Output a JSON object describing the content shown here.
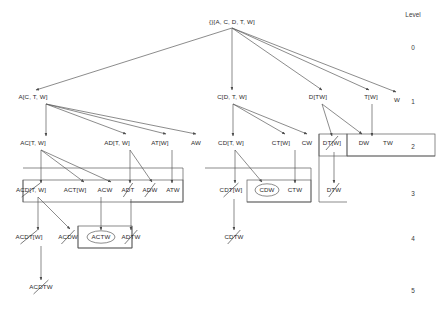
{
  "figure": {
    "type": "enumeration-tree",
    "background": "#ffffff",
    "line_color": "#5a5a5a",
    "text_color": "#2b2b2b"
  },
  "level_axis": {
    "header": "Level",
    "header_pos": {
      "x": 413,
      "y": 14
    },
    "labels": [
      {
        "text": "0",
        "x": 413,
        "y": 47
      },
      {
        "text": "1",
        "x": 413,
        "y": 101
      },
      {
        "text": "2",
        "x": 413,
        "y": 146
      },
      {
        "text": "3",
        "x": 413,
        "y": 193
      },
      {
        "text": "4",
        "x": 413,
        "y": 238
      },
      {
        "text": "5",
        "x": 413,
        "y": 290
      }
    ]
  },
  "nodes": [
    {
      "id": "root",
      "label": "{}[A, C, D, T, W]",
      "x": 232,
      "y": 22,
      "level": 0,
      "struck": false,
      "ellipse": false
    },
    {
      "id": "A",
      "label": "A[C, T, W]",
      "x": 33,
      "y": 97,
      "level": 1,
      "struck": false,
      "ellipse": false
    },
    {
      "id": "C",
      "label": "C[D, T, W]",
      "x": 232,
      "y": 97,
      "level": 1,
      "struck": false,
      "ellipse": false
    },
    {
      "id": "D",
      "label": "D[TW]",
      "x": 318,
      "y": 97,
      "level": 1,
      "struck": false,
      "ellipse": false
    },
    {
      "id": "T",
      "label": "T[W]",
      "x": 371,
      "y": 97,
      "level": 1,
      "struck": false,
      "ellipse": false
    },
    {
      "id": "W",
      "label": "W",
      "x": 397,
      "y": 100,
      "level": 1,
      "struck": false,
      "ellipse": false
    },
    {
      "id": "AC",
      "label": "AC[T, W]",
      "x": 33,
      "y": 143,
      "level": 2,
      "struck": false,
      "ellipse": false
    },
    {
      "id": "AD",
      "label": "AD[T, W]",
      "x": 117,
      "y": 143,
      "level": 2,
      "struck": false,
      "ellipse": false
    },
    {
      "id": "AT",
      "label": "AT[W]",
      "x": 160,
      "y": 143,
      "level": 2,
      "struck": false,
      "ellipse": false
    },
    {
      "id": "AW",
      "label": "AW",
      "x": 196,
      "y": 143,
      "level": 2,
      "struck": false,
      "ellipse": false
    },
    {
      "id": "CD",
      "label": "CD[T, W]",
      "x": 231,
      "y": 143,
      "level": 2,
      "struck": false,
      "ellipse": false
    },
    {
      "id": "CT",
      "label": "CT[W]",
      "x": 281,
      "y": 143,
      "level": 2,
      "struck": false,
      "ellipse": false
    },
    {
      "id": "CW",
      "label": "CW",
      "x": 307,
      "y": 143,
      "level": 2,
      "struck": false,
      "ellipse": false
    },
    {
      "id": "DT",
      "label": "DT[W]",
      "x": 332,
      "y": 143,
      "level": 2,
      "struck": true,
      "ellipse": false
    },
    {
      "id": "DW",
      "label": "DW",
      "x": 364,
      "y": 143,
      "level": 2,
      "struck": false,
      "ellipse": false
    },
    {
      "id": "TW",
      "label": "TW",
      "x": 388,
      "y": 143,
      "level": 2,
      "struck": false,
      "ellipse": false
    },
    {
      "id": "ACD",
      "label": "ACD[T, W]",
      "x": 31,
      "y": 190,
      "level": 3,
      "struck": true,
      "ellipse": false
    },
    {
      "id": "ACT",
      "label": "ACT[W]",
      "x": 75,
      "y": 190,
      "level": 3,
      "struck": false,
      "ellipse": false
    },
    {
      "id": "ACW",
      "label": "ACW",
      "x": 105,
      "y": 190,
      "level": 3,
      "struck": false,
      "ellipse": false
    },
    {
      "id": "ADT",
      "label": "ADT",
      "x": 128,
      "y": 190,
      "level": 3,
      "struck": true,
      "ellipse": false
    },
    {
      "id": "ADW",
      "label": "ADW",
      "x": 150,
      "y": 190,
      "level": 3,
      "struck": true,
      "ellipse": false
    },
    {
      "id": "ATW",
      "label": "ATW",
      "x": 173,
      "y": 190,
      "level": 3,
      "struck": false,
      "ellipse": false
    },
    {
      "id": "CDT",
      "label": "CDT[W]",
      "x": 231,
      "y": 190,
      "level": 3,
      "struck": true,
      "ellipse": false
    },
    {
      "id": "CDW",
      "label": "CDW",
      "x": 267,
      "y": 190,
      "level": 3,
      "struck": false,
      "ellipse": true
    },
    {
      "id": "CTW",
      "label": "CTW",
      "x": 295,
      "y": 190,
      "level": 3,
      "struck": false,
      "ellipse": false
    },
    {
      "id": "DTW",
      "label": "DTW",
      "x": 334,
      "y": 190,
      "level": 3,
      "struck": true,
      "ellipse": false
    },
    {
      "id": "ACDT",
      "label": "ACDT[W]",
      "x": 29,
      "y": 237,
      "level": 4,
      "struck": true,
      "ellipse": false
    },
    {
      "id": "ACDW",
      "label": "ACDW",
      "x": 68,
      "y": 237,
      "level": 4,
      "struck": true,
      "ellipse": false
    },
    {
      "id": "ACTW",
      "label": "ACTW",
      "x": 101,
      "y": 237,
      "level": 4,
      "struck": false,
      "ellipse": true
    },
    {
      "id": "ADTW",
      "label": "ADTW",
      "x": 131,
      "y": 237,
      "level": 4,
      "struck": true,
      "ellipse": false
    },
    {
      "id": "CDTW",
      "label": "CDTW",
      "x": 234,
      "y": 237,
      "level": 4,
      "struck": true,
      "ellipse": false
    },
    {
      "id": "ACDTW",
      "label": "ACDTW",
      "x": 41,
      "y": 287,
      "level": 5,
      "struck": true,
      "ellipse": false
    }
  ],
  "edges": [
    {
      "from": "root",
      "to": "A",
      "x1": 232,
      "y1": 28,
      "x2": 36,
      "y2": 90
    },
    {
      "from": "root",
      "to": "C",
      "x1": 232,
      "y1": 28,
      "x2": 232,
      "y2": 90
    },
    {
      "from": "root",
      "to": "D",
      "x1": 232,
      "y1": 28,
      "x2": 322,
      "y2": 90
    },
    {
      "from": "root",
      "to": "T",
      "x1": 232,
      "y1": 28,
      "x2": 369,
      "y2": 90
    },
    {
      "from": "root",
      "to": "W",
      "x1": 232,
      "y1": 28,
      "x2": 396,
      "y2": 92
    },
    {
      "from": "A",
      "to": "AC",
      "x1": 46,
      "y1": 104,
      "x2": 46,
      "y2": 136
    },
    {
      "from": "A",
      "to": "AD",
      "x1": 46,
      "y1": 104,
      "x2": 126,
      "y2": 134
    },
    {
      "from": "A",
      "to": "AT",
      "x1": 46,
      "y1": 104,
      "x2": 166,
      "y2": 134
    },
    {
      "from": "A",
      "to": "AW",
      "x1": 46,
      "y1": 104,
      "x2": 196,
      "y2": 134
    },
    {
      "from": "C",
      "to": "CD",
      "x1": 233,
      "y1": 104,
      "x2": 233,
      "y2": 136
    },
    {
      "from": "C",
      "to": "CT",
      "x1": 233,
      "y1": 104,
      "x2": 285,
      "y2": 134
    },
    {
      "from": "C",
      "to": "CW",
      "x1": 233,
      "y1": 104,
      "x2": 307,
      "y2": 134
    },
    {
      "from": "D",
      "to": "DT",
      "x1": 322,
      "y1": 104,
      "x2": 332,
      "y2": 136
    },
    {
      "from": "D",
      "to": "DW",
      "x1": 322,
      "y1": 104,
      "x2": 362,
      "y2": 134
    },
    {
      "from": "T",
      "to": "TW",
      "x1": 372,
      "y1": 104,
      "x2": 372,
      "y2": 136
    },
    {
      "from": "AC",
      "to": "ACD",
      "x1": 41,
      "y1": 150,
      "x2": 41,
      "y2": 183
    },
    {
      "from": "AC",
      "to": "ACT",
      "x1": 41,
      "y1": 150,
      "x2": 84,
      "y2": 182
    },
    {
      "from": "AC",
      "to": "ACW",
      "x1": 41,
      "y1": 150,
      "x2": 111,
      "y2": 182
    },
    {
      "from": "AD",
      "to": "ADT",
      "x1": 130,
      "y1": 150,
      "x2": 130,
      "y2": 183
    },
    {
      "from": "AD",
      "to": "ADW",
      "x1": 130,
      "y1": 150,
      "x2": 152,
      "y2": 182
    },
    {
      "from": "AT",
      "to": "ATW",
      "x1": 172,
      "y1": 150,
      "x2": 172,
      "y2": 183
    },
    {
      "from": "CD",
      "to": "CDT",
      "x1": 235,
      "y1": 150,
      "x2": 235,
      "y2": 183
    },
    {
      "from": "CD",
      "to": "CDW",
      "x1": 235,
      "y1": 150,
      "x2": 262,
      "y2": 182
    },
    {
      "from": "CT",
      "to": "CTW",
      "x1": 295,
      "y1": 150,
      "x2": 295,
      "y2": 183
    },
    {
      "from": "DT",
      "to": "DTW",
      "x1": 334,
      "y1": 152,
      "x2": 334,
      "y2": 183
    },
    {
      "from": "ACD",
      "to": "ACDT",
      "x1": 38,
      "y1": 197,
      "x2": 38,
      "y2": 230
    },
    {
      "from": "ACD",
      "to": "ACDW",
      "x1": 38,
      "y1": 197,
      "x2": 70,
      "y2": 229
    },
    {
      "from": "ACT",
      "to": "ACTW",
      "x1": 101,
      "y1": 197,
      "x2": 101,
      "y2": 230
    },
    {
      "from": "ADT",
      "to": "ADTW",
      "x1": 131,
      "y1": 199,
      "x2": 131,
      "y2": 230
    },
    {
      "from": "CDT",
      "to": "CDTW",
      "x1": 234,
      "y1": 199,
      "x2": 234,
      "y2": 230
    },
    {
      "from": "ACDT",
      "to": "ACDTW",
      "x1": 41,
      "y1": 246,
      "x2": 41,
      "y2": 280
    }
  ],
  "group_boxes": [
    {
      "id": "box-acd-group",
      "x": 23,
      "y": 180,
      "w": 160,
      "h": 22
    },
    {
      "id": "box-actw",
      "x": 78,
      "y": 226,
      "w": 54,
      "h": 22
    },
    {
      "id": "box-cdw-group",
      "x": 247,
      "y": 180,
      "w": 64,
      "h": 22
    },
    {
      "id": "box-dt",
      "x": 319,
      "y": 134,
      "w": 28,
      "h": 22
    },
    {
      "id": "box-dw-tw",
      "x": 347,
      "y": 134,
      "w": 88,
      "h": 22
    }
  ],
  "connector_paths": [
    {
      "id": "conn-left-top",
      "d": "M 23 168 L 183 168 L 183 202 L 130 202"
    },
    {
      "id": "conn-left-mid",
      "d": "M 23 180 L 23 202"
    },
    {
      "id": "conn-actw-box",
      "d": "M 132 226 L 132 248 L 78 248 L 78 226"
    },
    {
      "id": "conn-cd-box",
      "d": "M 205 168 L 311 168 L 311 202 L 247 202"
    },
    {
      "id": "conn-dt-box",
      "d": "M 319 134 L 319 202 L 347 202"
    },
    {
      "id": "conn-right-box",
      "d": "M 347 156 L 435 156"
    }
  ]
}
